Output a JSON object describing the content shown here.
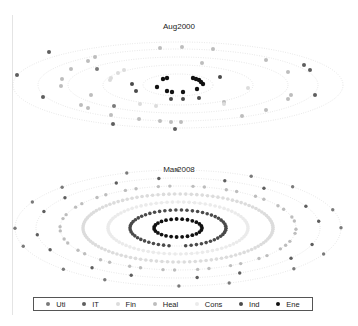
{
  "chart_data": [
    {
      "type": "scatter",
      "title": "Aug2000",
      "layout": "concentric elliptical rings (radial scatter), no axes, no grid",
      "center": [
        178,
        85
      ],
      "rings": [
        {
          "rx": 35,
          "ry": 11
        },
        {
          "rx": 75,
          "ry": 20
        },
        {
          "rx": 110,
          "ry": 28
        },
        {
          "rx": 140,
          "ry": 36
        },
        {
          "rx": 165,
          "ry": 43
        }
      ],
      "points": [
        {
          "sector": "Ene",
          "x": 163,
          "y": 79
        },
        {
          "sector": "Ene",
          "x": 167,
          "y": 78
        },
        {
          "sector": "Ene",
          "x": 157,
          "y": 87
        },
        {
          "sector": "Ene",
          "x": 167,
          "y": 91
        },
        {
          "sector": "Ene",
          "x": 172,
          "y": 92
        },
        {
          "sector": "Ene",
          "x": 183,
          "y": 92
        },
        {
          "sector": "Ene",
          "x": 193,
          "y": 78
        },
        {
          "sector": "Ene",
          "x": 196,
          "y": 79
        },
        {
          "sector": "Ene",
          "x": 199,
          "y": 80
        },
        {
          "sector": "Ene",
          "x": 201,
          "y": 82
        },
        {
          "sector": "Ene",
          "x": 203,
          "y": 84
        },
        {
          "sector": "Ene",
          "x": 197,
          "y": 89
        },
        {
          "sector": "Ind",
          "x": 132,
          "y": 84
        },
        {
          "sector": "Ind",
          "x": 136,
          "y": 91
        },
        {
          "sector": "Ind",
          "x": 171,
          "y": 99
        },
        {
          "sector": "Ind",
          "x": 183,
          "y": 99
        },
        {
          "sector": "Ind",
          "x": 199,
          "y": 98
        },
        {
          "sector": "Ind",
          "x": 220,
          "y": 77
        },
        {
          "sector": "IT",
          "x": 49,
          "y": 52
        },
        {
          "sector": "IT",
          "x": 17,
          "y": 75
        },
        {
          "sector": "IT",
          "x": 43,
          "y": 97
        },
        {
          "sector": "IT",
          "x": 113,
          "y": 124
        },
        {
          "sector": "IT",
          "x": 175,
          "y": 129
        },
        {
          "sector": "IT",
          "x": 304,
          "y": 65
        },
        {
          "sector": "IT",
          "x": 310,
          "y": 70
        },
        {
          "sector": "IT",
          "x": 315,
          "y": 95
        },
        {
          "sector": "Uti",
          "x": 114,
          "y": 106
        },
        {
          "sector": "Uti",
          "x": 97,
          "y": 69
        },
        {
          "sector": "Heal",
          "x": 160,
          "y": 48
        },
        {
          "sector": "Heal",
          "x": 182,
          "y": 47
        },
        {
          "sector": "Heal",
          "x": 213,
          "y": 49
        },
        {
          "sector": "Heal",
          "x": 88,
          "y": 61
        },
        {
          "sector": "Heal",
          "x": 95,
          "y": 57
        },
        {
          "sector": "Heal",
          "x": 71,
          "y": 69
        },
        {
          "sector": "Heal",
          "x": 62,
          "y": 79
        },
        {
          "sector": "Heal",
          "x": 61,
          "y": 86
        },
        {
          "sector": "Heal",
          "x": 91,
          "y": 95
        },
        {
          "sector": "Heal",
          "x": 81,
          "y": 105
        },
        {
          "sector": "Heal",
          "x": 88,
          "y": 108
        },
        {
          "sector": "Heal",
          "x": 111,
          "y": 115
        },
        {
          "sector": "Heal",
          "x": 139,
          "y": 119
        },
        {
          "sector": "Heal",
          "x": 160,
          "y": 121
        },
        {
          "sector": "Heal",
          "x": 171,
          "y": 122
        },
        {
          "sector": "Heal",
          "x": 181,
          "y": 122
        },
        {
          "sector": "Heal",
          "x": 242,
          "y": 116
        },
        {
          "sector": "Heal",
          "x": 266,
          "y": 110
        },
        {
          "sector": "Heal",
          "x": 288,
          "y": 99
        },
        {
          "sector": "Heal",
          "x": 291,
          "y": 95
        },
        {
          "sector": "Heal",
          "x": 288,
          "y": 72
        },
        {
          "sector": "Heal",
          "x": 266,
          "y": 60
        },
        {
          "sector": "Heal",
          "x": 202,
          "y": 63
        },
        {
          "sector": "Heal",
          "x": 224,
          "y": 102
        },
        {
          "sector": "Fin",
          "x": 118,
          "y": 73
        },
        {
          "sector": "Fin",
          "x": 124,
          "y": 70
        },
        {
          "sector": "Fin",
          "x": 111,
          "y": 78
        },
        {
          "sector": "Fin",
          "x": 110,
          "y": 80
        },
        {
          "sector": "Fin",
          "x": 140,
          "y": 104
        },
        {
          "sector": "Fin",
          "x": 156,
          "y": 106
        },
        {
          "sector": "Fin",
          "x": 248,
          "y": 88
        },
        {
          "sector": "Fin",
          "x": 224,
          "y": 104
        }
      ]
    },
    {
      "type": "scatter",
      "title": "Mar2008",
      "layout": "concentric elliptical rings (radial scatter), no axes, no grid",
      "center": [
        178,
        228
      ],
      "rings": [
        {
          "rx": 24,
          "ry": 9,
          "sector": "Ene",
          "filled": "full"
        },
        {
          "rx": 48,
          "ry": 18,
          "sector": "Ind",
          "filled": "full"
        },
        {
          "rx": 70,
          "ry": 26,
          "sector": "Cons",
          "filled": "full"
        },
        {
          "rx": 95,
          "ry": 34,
          "sector": "Fin",
          "filled": "full"
        },
        {
          "rx": 118,
          "ry": 42,
          "sector": "Heal",
          "filled": "partial"
        },
        {
          "rx": 142,
          "ry": 50,
          "sector": "IT",
          "filled": "sparse"
        },
        {
          "rx": 163,
          "ry": 58,
          "sector": "Uti",
          "filled": "sparse"
        }
      ]
    }
  ],
  "legend": {
    "items": [
      {
        "label": "Uti",
        "color": "#7a7a7a"
      },
      {
        "label": "IT",
        "color": "#5e5e5e"
      },
      {
        "label": "Fin",
        "color": "#dcdcdc"
      },
      {
        "label": "Heal",
        "color": "#bdbdbd"
      },
      {
        "label": "Cons",
        "color": "#ebebeb"
      },
      {
        "label": "Ind",
        "color": "#4a4a4a"
      },
      {
        "label": "Ene",
        "color": "#111111"
      }
    ]
  },
  "panels": {
    "top_title": "Aug2000",
    "bottom_title": "Mar2008"
  }
}
